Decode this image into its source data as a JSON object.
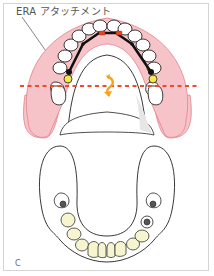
{
  "figure": {
    "callout_label": "ERA アタッチメント",
    "panel_letter": "C"
  },
  "colors": {
    "gum_pink": "#f6c4c8",
    "gum_outline": "#e3808a",
    "tooth_white": "#ffffff",
    "tooth_outline": "#222222",
    "bar_black": "#111111",
    "attachment_red": "#e8441f",
    "attachment_yellow": "#f5e84a",
    "dotted_line": "#ef4b2a",
    "rotation_arrow": "#f7a21b",
    "lower_tooth": "#f7f5cf",
    "implant_dark": "#555555",
    "frame_border": "#d4d4d4"
  },
  "elements": {
    "upper_jaw": "upper-denture-with-bar",
    "lower_jaw": "lower-arch-with-implants",
    "rotation_axis": "dotted-fulcrum-line",
    "rotation_icon": "rotation-arrow"
  }
}
